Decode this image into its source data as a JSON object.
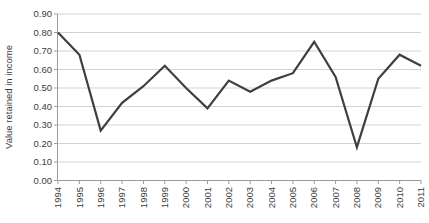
{
  "chart_data": {
    "type": "line",
    "title": "",
    "xlabel": "",
    "ylabel": "Value retained in income",
    "categories": [
      "1994",
      "1995",
      "1996",
      "1997",
      "1998",
      "1999",
      "2000",
      "2001",
      "2002",
      "2003",
      "2004",
      "2005",
      "2006",
      "2007",
      "2008",
      "2009",
      "2010",
      "2011"
    ],
    "series": [
      {
        "name": "Value retained in income",
        "values": [
          0.8,
          0.68,
          0.27,
          0.42,
          0.51,
          0.62,
          0.5,
          0.39,
          0.54,
          0.48,
          0.54,
          0.58,
          0.75,
          0.56,
          0.18,
          0.55,
          0.68,
          0.62
        ]
      }
    ],
    "ylim": [
      0.0,
      0.9
    ],
    "ytick_step": 0.1,
    "ytick_labels": [
      "0.00",
      "0.10",
      "0.20",
      "0.30",
      "0.40",
      "0.50",
      "0.60",
      "0.70",
      "0.80",
      "0.90"
    ],
    "grid": "horizontal",
    "legend_position": "none",
    "x_label_rotation_deg": 90,
    "colors": {
      "line": "#3f3f3f",
      "gridline": "#d3d3d3",
      "axis": "#9b9b9b",
      "tick": "#9b9b9b",
      "text": "#3c3c3c",
      "background": "#ffffff"
    }
  }
}
